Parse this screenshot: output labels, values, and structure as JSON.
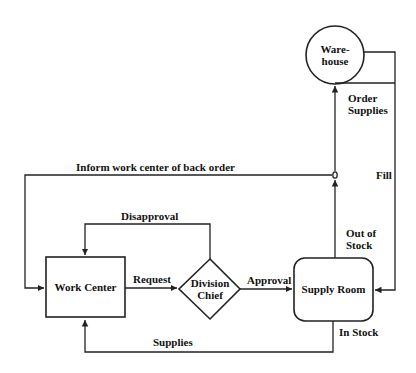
{
  "diagram": {
    "nodes": {
      "warehouse": {
        "line1": "Ware-",
        "line2": "house",
        "shape": "circle"
      },
      "work_center": {
        "label": "Work Center",
        "shape": "rectangle"
      },
      "division_chief": {
        "line1": "Division",
        "line2": "Chief",
        "shape": "diamond"
      },
      "supply_room": {
        "label": "Supply Room",
        "shape": "rounded-rectangle"
      }
    },
    "edges": {
      "inform": "Inform work center of back order",
      "disapproval": "Disapproval",
      "request": "Request",
      "approval": "Approval",
      "supplies": "Supplies",
      "in_stock": "In Stock",
      "out_of_stock_1": "Out of",
      "out_of_stock_2": "Stock",
      "order_supplies_1": "Order",
      "order_supplies_2": "Supplies",
      "fill": "Fill"
    }
  }
}
